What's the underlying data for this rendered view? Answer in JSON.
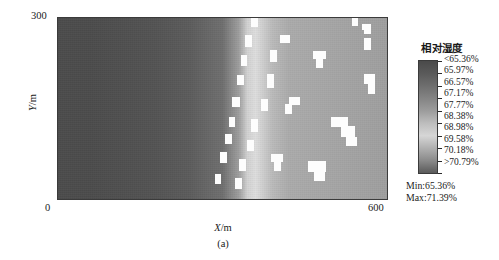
{
  "figure": {
    "caption": "(a)",
    "x_axis": {
      "label": "X/m",
      "label_var": "X",
      "label_unit": "/m",
      "min": "0",
      "max": "600"
    },
    "y_axis": {
      "label": "Y/m",
      "label_var": "Y",
      "label_unit": "/m",
      "min": "0",
      "max": "300"
    }
  },
  "legend": {
    "title": "相对湿度",
    "labels": [
      "<65.36%",
      "65.97%",
      "66.57%",
      "67.17%",
      "67.77%",
      "68.38%",
      "68.98%",
      "69.58%",
      "70.18%",
      ">70.79%"
    ],
    "min_label": "Min:65.36%",
    "max_label": "Max:71.39%",
    "colorbar_top_color": "#4a4a4a",
    "colorbar_mid_color": "#d8d8d8",
    "colorbar_bottom_color": "#555555"
  },
  "chart_data": {
    "type": "heatmap",
    "title": "",
    "xlabel": "X/m",
    "ylabel": "Y/m",
    "xlim": [
      0,
      600
    ],
    "ylim": [
      0,
      300
    ],
    "grid": false,
    "legend_position": "right",
    "colormap": "grayscale",
    "variable": "相对湿度",
    "unit": "%",
    "value_min": 65.36,
    "value_max": 71.39,
    "color_levels": [
      {
        "label": "<65.36%",
        "value": 65.36,
        "color": "#4a4a4a"
      },
      {
        "label": "65.97%",
        "value": 65.97,
        "color": "#5a5a5a"
      },
      {
        "label": "66.57%",
        "value": 66.57,
        "color": "#6e6e6e"
      },
      {
        "label": "67.17%",
        "value": 67.17,
        "color": "#848484"
      },
      {
        "label": "67.77%",
        "value": 67.77,
        "color": "#9c9c9c"
      },
      {
        "label": "68.38%",
        "value": 68.38,
        "color": "#bdbdbd"
      },
      {
        "label": "68.98%",
        "value": 68.98,
        "color": "#d6d6d6"
      },
      {
        "label": "69.58%",
        "value": 69.58,
        "color": "#b0b0b0"
      },
      {
        "label": "70.18%",
        "value": 70.18,
        "color": "#8a8a8a"
      },
      {
        "label": ">70.79%",
        "value": 70.79,
        "color": "#5a5a5a"
      }
    ],
    "field_description": "Relative humidity field: uniformly dark (low, ~65.4-66%) across the left 55% of the domain, rising steeply through a bright vertical band near X=330-360 m (peak ~69%), then settling to a mid-grey plateau (~67.5-68%) across the right third, which is speckled with saturated white cells exceeding the upper colour limit.",
    "x_profile": {
      "x": [
        0,
        60,
        120,
        180,
        240,
        300,
        330,
        345,
        360,
        390,
        420,
        480,
        540,
        600
      ],
      "values": [
        65.5,
        65.5,
        65.6,
        65.7,
        65.9,
        66.4,
        67.6,
        68.9,
        69.2,
        68.3,
        67.9,
        67.8,
        67.7,
        67.6
      ]
    },
    "saturated_cells": [
      {
        "x": 352,
        "y": 283,
        "w": 13,
        "h": 16
      },
      {
        "x": 535,
        "y": 285,
        "w": 11,
        "h": 22
      },
      {
        "x": 556,
        "y": 272,
        "w": 13,
        "h": 17
      },
      {
        "x": 341,
        "y": 251,
        "w": 12,
        "h": 19
      },
      {
        "x": 405,
        "y": 257,
        "w": 18,
        "h": 14
      },
      {
        "x": 556,
        "y": 246,
        "w": 13,
        "h": 20
      },
      {
        "x": 333,
        "y": 219,
        "w": 12,
        "h": 18
      },
      {
        "x": 386,
        "y": 226,
        "w": 13,
        "h": 20
      },
      {
        "x": 464,
        "y": 231,
        "w": 24,
        "h": 14
      },
      {
        "x": 470,
        "y": 216,
        "w": 12,
        "h": 16
      },
      {
        "x": 327,
        "y": 188,
        "w": 12,
        "h": 17
      },
      {
        "x": 381,
        "y": 184,
        "w": 13,
        "h": 22
      },
      {
        "x": 557,
        "y": 190,
        "w": 20,
        "h": 16
      },
      {
        "x": 563,
        "y": 174,
        "w": 13,
        "h": 17
      },
      {
        "x": 318,
        "y": 152,
        "w": 13,
        "h": 17
      },
      {
        "x": 420,
        "y": 155,
        "w": 20,
        "h": 14
      },
      {
        "x": 414,
        "y": 141,
        "w": 12,
        "h": 16
      },
      {
        "x": 369,
        "y": 146,
        "w": 13,
        "h": 20
      },
      {
        "x": 311,
        "y": 120,
        "w": 12,
        "h": 16
      },
      {
        "x": 352,
        "y": 112,
        "w": 13,
        "h": 21
      },
      {
        "x": 497,
        "y": 120,
        "w": 30,
        "h": 16
      },
      {
        "x": 515,
        "y": 104,
        "w": 26,
        "h": 17
      },
      {
        "x": 524,
        "y": 88,
        "w": 20,
        "h": 16
      },
      {
        "x": 305,
        "y": 92,
        "w": 12,
        "h": 16
      },
      {
        "x": 345,
        "y": 80,
        "w": 13,
        "h": 19
      },
      {
        "x": 296,
        "y": 60,
        "w": 13,
        "h": 18
      },
      {
        "x": 388,
        "y": 62,
        "w": 22,
        "h": 14
      },
      {
        "x": 394,
        "y": 48,
        "w": 12,
        "h": 16
      },
      {
        "x": 330,
        "y": 48,
        "w": 13,
        "h": 19
      },
      {
        "x": 455,
        "y": 46,
        "w": 32,
        "h": 18
      },
      {
        "x": 466,
        "y": 31,
        "w": 20,
        "h": 17
      },
      {
        "x": 286,
        "y": 26,
        "w": 12,
        "h": 17
      },
      {
        "x": 322,
        "y": 18,
        "w": 13,
        "h": 18
      },
      {
        "x": 553,
        "y": 278,
        "w": 9,
        "h": 10
      }
    ]
  }
}
